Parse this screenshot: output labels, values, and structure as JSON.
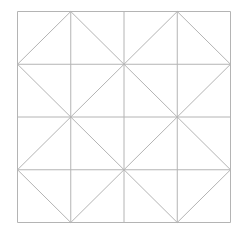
{
  "diagram": {
    "title": "",
    "grid": {
      "rows": 4,
      "cols": 4
    },
    "quadrant_diamonds": 4,
    "line_color": "#b4b4b4",
    "background": "#ffffff"
  }
}
